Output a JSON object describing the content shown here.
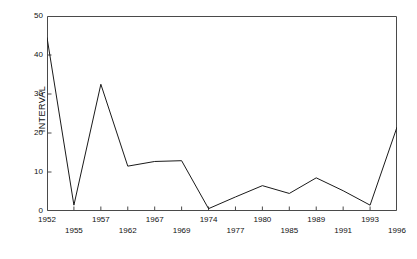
{
  "chart_data": {
    "type": "line",
    "title": "",
    "xlabel": "",
    "ylabel": "INTERVAL",
    "ylim": [
      0,
      50
    ],
    "yticks": [
      0,
      10,
      20,
      30,
      40,
      50
    ],
    "ytick_labels": [
      "0",
      "10",
      "20",
      "30",
      "40",
      "50"
    ],
    "grid": false,
    "legend": null,
    "x": [
      1952,
      1955,
      1957,
      1962,
      1967,
      1969,
      1974,
      1977,
      1980,
      1985,
      1989,
      1991,
      1993,
      1996
    ],
    "xtick_labels_upper": [
      "1952",
      "1957",
      "1967",
      "1974",
      "1980",
      "1989",
      "1993"
    ],
    "xtick_labels_lower": [
      "1955",
      "1962",
      "1969",
      "1977",
      "1985",
      "1991",
      "1996"
    ],
    "categories": [
      "1952",
      "1955",
      "1957",
      "1962",
      "1967",
      "1969",
      "1974",
      "1977",
      "1980",
      "1985",
      "1989",
      "1991",
      "1993",
      "1996"
    ],
    "values": [
      44.5,
      1.5,
      32.5,
      11.5,
      12.7,
      12.9,
      0.6,
      3.6,
      6.5,
      4.5,
      8.5,
      5.2,
      1.5,
      21.5
    ],
    "series": [
      {
        "name": "INTERVAL",
        "color": "#1a1a1a",
        "values": [
          44.5,
          1.5,
          32.5,
          11.5,
          12.7,
          12.9,
          0.6,
          3.6,
          6.5,
          4.5,
          8.5,
          5.2,
          1.5,
          21.5
        ]
      }
    ]
  },
  "axes": {
    "y_axis_name": "y-axis",
    "x_axis_name": "x-axis",
    "top_spine": "top-spine",
    "right_spine": "right-spine"
  },
  "colors": {
    "line": "#1a1a1a",
    "axis": "#4a4a4a",
    "background": "#ffffff",
    "text": "#111111"
  }
}
